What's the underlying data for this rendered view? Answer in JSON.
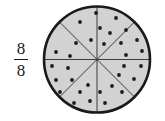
{
  "figure": {
    "background_color": "#ffffff"
  },
  "fraction": {
    "numerator": "8",
    "denominator": "8",
    "bar_color": "#1a1a1a",
    "text_color": "#1a1a1a"
  },
  "chart_data": {
    "type": "pie",
    "title": "",
    "subtitle": "",
    "xlabel": "",
    "ylabel": "",
    "grid": false,
    "legend": "none",
    "total_slices": 8,
    "shaded_slices": 8,
    "fraction_label": "8/8",
    "categories": [
      "1",
      "2",
      "3",
      "4",
      "5",
      "6",
      "7",
      "8"
    ],
    "values": [
      1,
      1,
      1,
      1,
      1,
      1,
      1,
      1
    ],
    "slice_angle_degrees": 45,
    "annotations": [
      {
        "text": "8",
        "role": "numerator"
      },
      {
        "text": "8",
        "role": "denominator"
      }
    ],
    "counters": {
      "dot_total": 32,
      "dots_per_slice": 4,
      "dot_radius": 1.9,
      "dot_color": "#1c1c1c"
    },
    "geometry": {
      "center_x": 97,
      "center_y": 59.5,
      "radius": 53,
      "fill_color": "#d2d2d2",
      "outline_color": "#1a1a1a",
      "outline_width": 2.6,
      "divider_color": "#2a2a2a",
      "divider_width": 0.9
    },
    "dot_positions": [
      [
        96,
        13
      ],
      [
        80,
        22
      ],
      [
        100,
        28
      ],
      [
        91,
        40
      ],
      [
        116,
        18
      ],
      [
        126,
        30
      ],
      [
        110,
        33
      ],
      [
        104,
        44
      ],
      [
        137,
        40
      ],
      [
        121,
        43
      ],
      [
        142,
        51
      ],
      [
        126,
        55
      ],
      [
        141,
        66
      ],
      [
        124,
        66
      ],
      [
        134,
        79
      ],
      [
        119,
        75
      ],
      [
        112,
        86
      ],
      [
        122,
        92
      ],
      [
        100,
        92
      ],
      [
        105,
        103
      ],
      [
        90,
        101
      ],
      [
        80,
        92
      ],
      [
        88,
        85
      ],
      [
        74,
        103
      ],
      [
        60,
        92
      ],
      [
        72,
        80
      ],
      [
        56,
        80
      ],
      [
        68,
        68
      ],
      [
        52,
        66
      ],
      [
        56,
        52
      ],
      [
        70,
        56
      ],
      [
        76,
        43
      ]
    ],
    "dividers": [
      {
        "name": "vertical",
        "angle_degrees": 90
      },
      {
        "name": "horizontal",
        "angle_degrees": 0
      },
      {
        "name": "diagonal-nw-se",
        "angle_degrees": 45
      },
      {
        "name": "diagonal-ne-sw",
        "angle_degrees": 135
      }
    ]
  }
}
